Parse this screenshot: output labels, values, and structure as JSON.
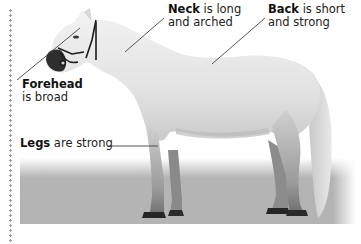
{
  "labels": {
    "neck": {
      "term": "Neck",
      "line1_rest": " is long",
      "line2": "and arched"
    },
    "back": {
      "term": "Back",
      "line1_rest": " is short",
      "line2": "and strong"
    },
    "forehead": {
      "term": "Forehead",
      "line2": "is broad"
    },
    "legs": {
      "term": "Legs",
      "rest": " are strong"
    }
  },
  "image": {
    "subject": "grey-white horse standing on gravel, side view, wearing a dark bridle",
    "icon": "horse-photo"
  },
  "colors": {
    "background": "#ffffff",
    "text": "#1a1a1a",
    "leader_line": "#444444",
    "horse_body": "#e6e6e6",
    "gravel": "#9c9c9c"
  }
}
